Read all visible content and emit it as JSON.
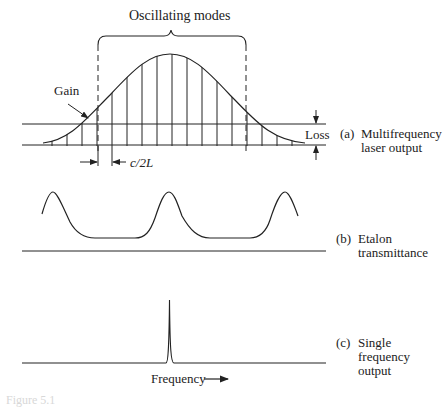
{
  "title_top": "Oscillating modes",
  "panel_a": {
    "gain_label": "Gain",
    "loss_label": "Loss",
    "spacing_label": "c/2L",
    "label_prefix": "(a)",
    "label_line1": "Multifrequency",
    "label_line2": "laser output"
  },
  "panel_b": {
    "label_prefix": "(b)",
    "label_line1": "Etalon",
    "label_line2": "transmittance"
  },
  "panel_c": {
    "label_prefix": "(c)",
    "label_line1": "Single",
    "label_line2": "frequency",
    "label_line3": "output",
    "axis_label": "Frequency"
  },
  "caption": "Figure 5.1",
  "colors": {
    "ink": "#222222",
    "background": "#ffffff"
  }
}
